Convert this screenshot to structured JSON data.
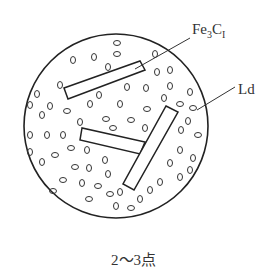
{
  "diagram": {
    "labels": {
      "cementite": {
        "base": "Fe",
        "sub1": "3",
        "mid": "C",
        "sub2": "I"
      },
      "ledeburite": "Ld"
    },
    "caption": "2～3点",
    "colors": {
      "stroke": "#222222",
      "text": "#333333",
      "background": "#ffffff"
    }
  }
}
